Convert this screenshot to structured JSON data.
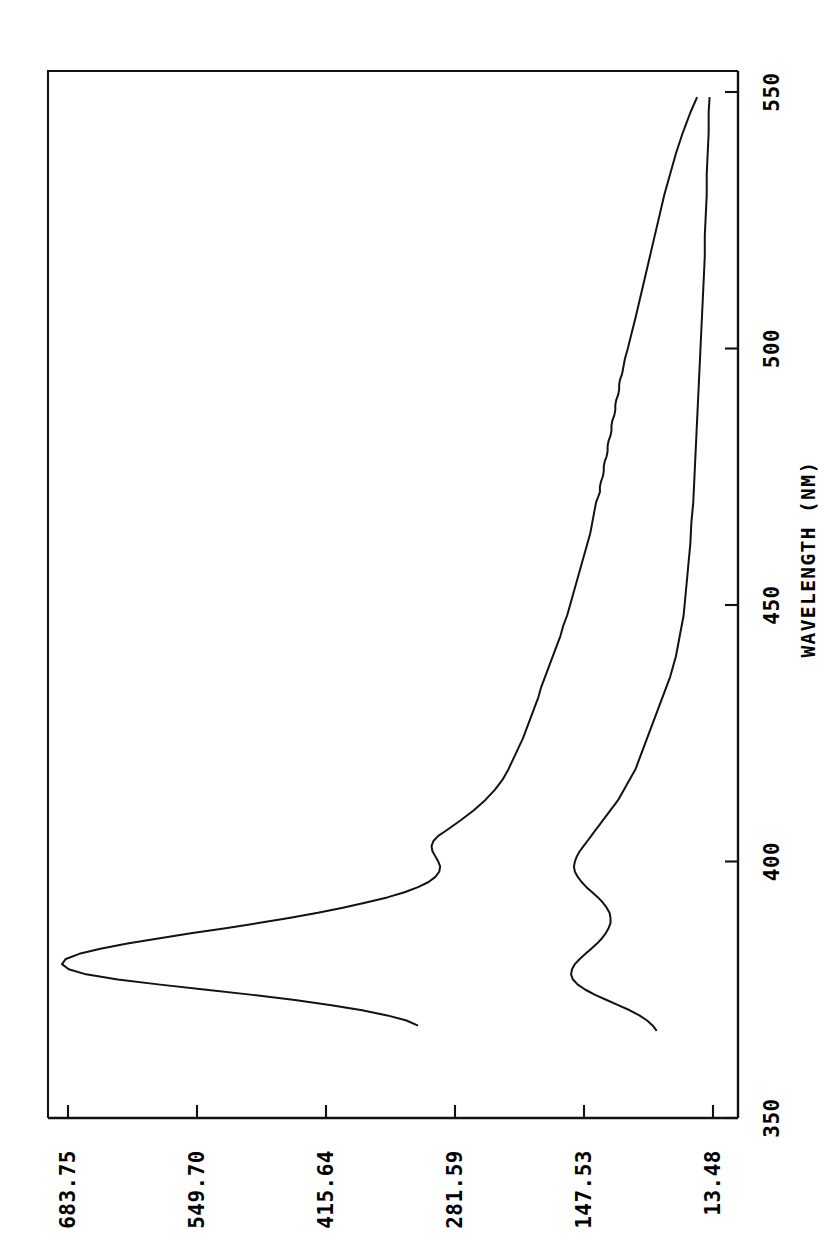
{
  "figure": {
    "kind": "spectrum-plot",
    "background_color": "#ffffff",
    "ink_color": "#111111",
    "orientation_note": "landscape plot rotated 90 degrees counter-clockwise on portrait page"
  },
  "chart_data": {
    "type": "line",
    "title": "",
    "subtitle": "",
    "xlabel": "WAVELENGTH (NM)",
    "ylabel": "",
    "xlim": [
      350,
      550
    ],
    "ylim": [
      13.48,
      683.75
    ],
    "xticks": [
      350,
      400,
      450,
      500,
      550
    ],
    "xtick_labels": [
      "350",
      "400",
      "450",
      "500",
      "550"
    ],
    "yticks": [
      13.48,
      147.53,
      281.59,
      415.64,
      549.7,
      683.75
    ],
    "ytick_labels": [
      "13.48",
      "147.53",
      "281.59",
      "415.64",
      "549.70",
      "683.75"
    ],
    "grid": false,
    "legend": false,
    "legend_position": "none",
    "annotations": [],
    "series": [
      {
        "name": "trace-1",
        "label": "",
        "color": "#121212",
        "x": [
          368,
          369,
          370,
          371,
          372,
          373,
          374,
          375,
          376,
          377,
          378,
          379,
          380,
          381,
          382,
          383,
          384,
          385,
          386,
          387,
          388,
          389,
          390,
          391,
          392,
          393,
          394,
          395,
          396,
          397,
          398,
          399,
          400,
          401,
          402,
          403,
          404,
          405,
          406,
          408,
          410,
          412,
          414,
          416,
          418,
          420,
          422,
          424,
          426,
          428,
          430,
          432,
          434,
          436,
          438,
          440,
          442,
          444,
          446,
          448,
          450,
          452,
          454,
          456,
          458,
          460,
          462,
          464,
          466,
          468,
          470,
          471,
          472,
          473,
          474,
          475,
          476,
          477,
          478,
          479,
          480,
          481,
          482,
          483,
          484,
          485,
          486,
          487,
          488,
          489,
          490,
          491,
          492,
          493,
          494,
          495,
          496,
          498,
          500,
          503,
          506,
          510,
          514,
          518,
          522,
          526,
          530,
          534,
          538,
          542,
          546,
          549
        ],
        "y": [
          320,
          332,
          352,
          378,
          410,
          448,
          492,
          540,
          588,
          632,
          665,
          683,
          690,
          686,
          672,
          650,
          622,
          590,
          556,
          520,
          486,
          454,
          424,
          398,
          374,
          352,
          334,
          320,
          309,
          302,
          298,
          297,
          299,
          302,
          305,
          306,
          304,
          299,
          291,
          276,
          262,
          250,
          240,
          232,
          226,
          221,
          216,
          211,
          207,
          203,
          199,
          195,
          192,
          188,
          184,
          180,
          176,
          172,
          169,
          165,
          162,
          159,
          156,
          153,
          150,
          147,
          144,
          141,
          139,
          137,
          135,
          133,
          131,
          131,
          130,
          128,
          127,
          127,
          126,
          124,
          123,
          123,
          122,
          120,
          119,
          119,
          118,
          116,
          115,
          115,
          114,
          112,
          111,
          111,
          110,
          108,
          107,
          105,
          102,
          98,
          94,
          89,
          84,
          79,
          74,
          69,
          64,
          58,
          52,
          45,
          37,
          30
        ]
      },
      {
        "name": "trace-2",
        "label": "",
        "color": "#121212",
        "x": [
          367,
          368,
          369,
          370,
          371,
          372,
          373,
          374,
          375,
          376,
          377,
          378,
          379,
          380,
          381,
          382,
          383,
          384,
          385,
          386,
          387,
          388,
          389,
          390,
          391,
          392,
          393,
          394,
          395,
          396,
          397,
          398,
          399,
          400,
          401,
          402,
          403,
          404,
          405,
          406,
          407,
          408,
          409,
          410,
          411,
          412,
          413,
          414,
          415,
          416,
          417,
          418,
          419,
          420,
          422,
          424,
          426,
          428,
          430,
          432,
          434,
          436,
          438,
          440,
          442,
          444,
          446,
          448,
          450,
          454,
          458,
          462,
          466,
          470,
          474,
          478,
          482,
          486,
          490,
          494,
          498,
          502,
          506,
          510,
          514,
          518,
          522,
          526,
          530,
          534,
          538,
          542,
          546,
          549
        ],
        "y": [
          72,
          76,
          82,
          90,
          100,
          112,
          124,
          136,
          146,
          154,
          159,
          161,
          160,
          157,
          152,
          146,
          140,
          134,
          129,
          125,
          122,
          120,
          120,
          121,
          124,
          128,
          133,
          139,
          145,
          150,
          154,
          157,
          158,
          157,
          155,
          152,
          148,
          144,
          140,
          136,
          132,
          128,
          124,
          120,
          116,
          112,
          109,
          106,
          103,
          100,
          97,
          94,
          92,
          90,
          86,
          82,
          78,
          74,
          70,
          66,
          62,
          58,
          55,
          52,
          50,
          48,
          46,
          44,
          43,
          41,
          39,
          37,
          36,
          34,
          33,
          32,
          31,
          30,
          29,
          28,
          27,
          26,
          25,
          24,
          23,
          22,
          22,
          21,
          20,
          20,
          19,
          18,
          18,
          17
        ]
      }
    ]
  }
}
